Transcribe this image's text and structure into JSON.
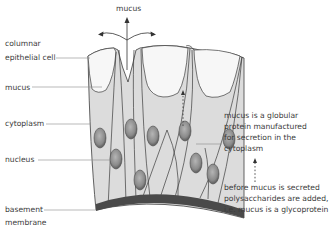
{
  "labels": {
    "mucus_top": "mucus",
    "columnar_line1": "columnar",
    "columnar_line2": "epithelial cell",
    "mucus_left": "mucus",
    "cytoplasm": "cytoplasm",
    "nucleus": "nucleus",
    "basement_line1": "basement",
    "basement_line2": "membrane"
  },
  "notes": {
    "protein": [
      "mucus is a globular",
      "protein manufactured",
      "for secretion in the",
      "cytoplasm"
    ],
    "glycoprotein": [
      "before mucus is secreted",
      "polysaccharides are added,",
      "i.e. mucus is a glycoprotein"
    ]
  },
  "colors": {
    "cytoplasm_fill": "#dcdcdc",
    "mucus_fill": "#f7f7f7",
    "outline": "#3c3c3c",
    "nucleus_fill": "#8a8a8a",
    "basement_membrane": "#4a4a4a",
    "leader_line": "#8c8c8c",
    "text": "#3a3a3a"
  }
}
